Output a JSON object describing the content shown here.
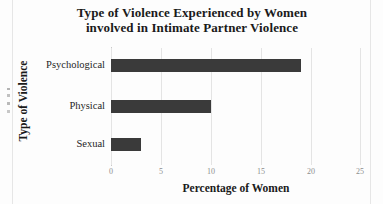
{
  "chart_data": {
    "type": "bar",
    "orientation": "horizontal",
    "title": "Type of Violence Experienced by Women involved in Intimate Partner Violence",
    "title_lines": [
      "Type of Violence Experienced by Women",
      "involved in Intimate Partner Violence"
    ],
    "categories": [
      "Psychological",
      "Physical",
      "Sexual"
    ],
    "values": [
      19,
      10,
      3
    ],
    "xlabel": "Percentage of Women",
    "ylabel": "Type of Violence",
    "xlim": [
      0,
      25
    ],
    "xticks": [
      0,
      5,
      10,
      15,
      20,
      25
    ],
    "xtick_labels": [
      "0",
      "5",
      "10",
      "15",
      "20",
      "25"
    ],
    "grid": "vertical",
    "legend": "none",
    "bar_color": "#3a3a3a",
    "gridline_color": "#e4e4e4",
    "axis_color": "#c9c9c9",
    "background": "#fdfdfd"
  }
}
